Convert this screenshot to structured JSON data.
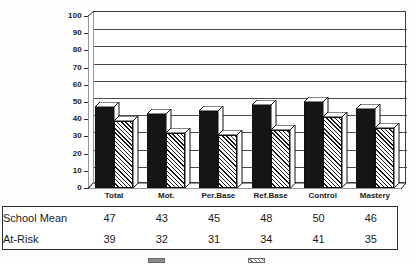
{
  "chart_data": {
    "type": "bar",
    "title": "",
    "subtitle": "",
    "xlabel": "",
    "ylabel": "",
    "ylim": [
      0,
      100
    ],
    "grid": true,
    "legend_position": "bottom",
    "categories": [
      "Total",
      "Mot.",
      "Per.Base",
      "Ref.Base",
      "Control",
      "Mastery"
    ],
    "yticks": [
      "100",
      "90",
      "80",
      "70",
      "60",
      "50",
      "40",
      "30",
      "20",
      "10",
      "0"
    ],
    "series": [
      {
        "name": "School Mean",
        "style": "solid-black",
        "values": [
          47,
          43,
          45,
          48,
          50,
          46
        ]
      },
      {
        "name": "At-Risk",
        "style": "diagonal-hatch",
        "values": [
          39,
          32,
          31,
          34,
          41,
          35
        ]
      }
    ]
  },
  "table": {
    "rows": [
      {
        "label": "School Mean",
        "values": [
          "47",
          "43",
          "45",
          "48",
          "50",
          "46"
        ]
      },
      {
        "label": "At-Risk",
        "values": [
          "39",
          "32",
          "31",
          "34",
          "41",
          "35"
        ]
      }
    ]
  },
  "legend": {
    "entries": [
      {
        "name": "School Mean",
        "swatch": "solid-black"
      },
      {
        "name": "At-Risk",
        "swatch": "diagonal-hatch"
      }
    ]
  }
}
